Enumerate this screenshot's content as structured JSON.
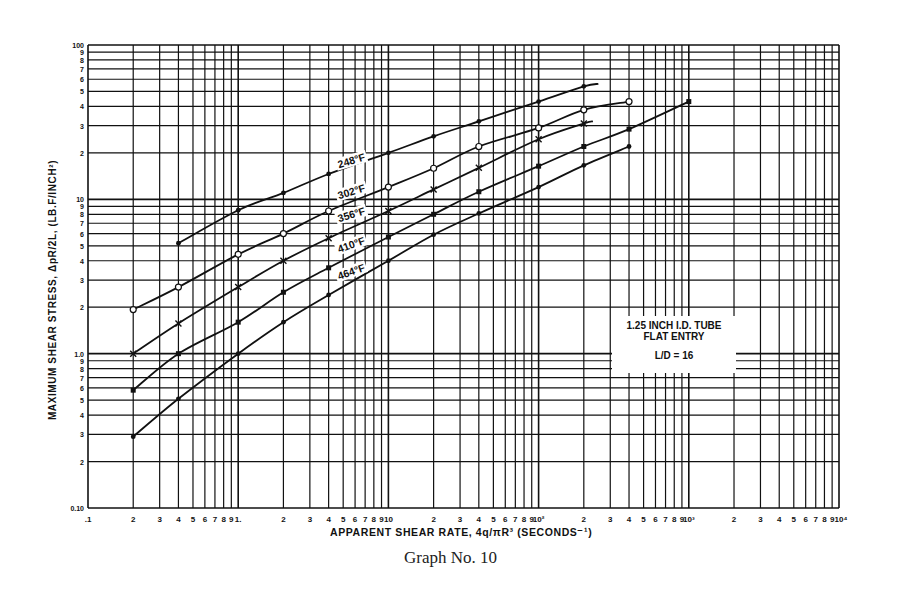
{
  "caption": "Graph No. 10",
  "chart_data": {
    "type": "line",
    "title": "",
    "xlabel": "APPARENT SHEAR RATE, 4q/πR³ (SECONDS⁻¹)",
    "ylabel": "MAXIMUM SHEAR STRESS, ΔpR/2L, (LB.F/INCH²)",
    "xscale": "log",
    "yscale": "log",
    "xlim": [
      0.1,
      10000
    ],
    "ylim": [
      0.1,
      100
    ],
    "grid": true,
    "x_tick_labels": [
      ".1",
      "2",
      "3",
      "4",
      "5",
      "6",
      "7",
      "8",
      "9",
      "1.",
      "2",
      "3",
      "4",
      "5",
      "6",
      "7",
      "8",
      "9",
      "10",
      "2",
      "3",
      "4",
      "5",
      "6",
      "7",
      "8",
      "9",
      "10²",
      "2",
      "3",
      "4",
      "5",
      "6",
      "7",
      "8",
      "9",
      "10³",
      "2",
      "3",
      "4",
      "5",
      "6",
      "7",
      "8",
      "9",
      "10⁴"
    ],
    "y_tick_labels": [
      "0.10",
      "2",
      "3",
      "4",
      "5",
      "6",
      "7",
      "8",
      "9",
      "1.0",
      "2",
      "3",
      "4",
      "5",
      "6",
      "7",
      "8",
      "9",
      "10",
      "2",
      "3",
      "4",
      "5",
      "6",
      "7",
      "8",
      "9",
      "100"
    ],
    "annotation": {
      "line1": "1.25 INCH I.D. TUBE",
      "line2": "FLAT ENTRY",
      "line3": "L/D = 16"
    },
    "series": [
      {
        "name": "248°F",
        "marker": "dot",
        "x": [
          0.4,
          1,
          2,
          4,
          10,
          20,
          40,
          100,
          200,
          250
        ],
        "y": [
          5.2,
          8.5,
          11,
          14.6,
          20,
          25.6,
          32,
          43,
          54,
          56
        ]
      },
      {
        "name": "302°F",
        "marker": "circle",
        "x": [
          0.2,
          0.4,
          1,
          2,
          4,
          10,
          20,
          40,
          100,
          200,
          400
        ],
        "y": [
          1.93,
          2.7,
          4.4,
          6.0,
          8.4,
          12,
          15.9,
          22,
          29,
          38,
          43
        ]
      },
      {
        "name": "356°F",
        "marker": "cross",
        "x": [
          0.2,
          0.4,
          1,
          2,
          4,
          10,
          20,
          40,
          100,
          200,
          230
        ],
        "y": [
          1.0,
          1.57,
          2.7,
          4.0,
          5.6,
          8.4,
          11.6,
          16,
          24.5,
          31,
          32
        ]
      },
      {
        "name": "410°F",
        "marker": "square",
        "x": [
          0.2,
          0.4,
          1,
          2,
          4,
          10,
          20,
          40,
          100,
          200,
          400,
          1000
        ],
        "y": [
          0.58,
          1.0,
          1.6,
          2.5,
          3.6,
          5.7,
          8.0,
          11.2,
          16.4,
          22,
          28.5,
          43
        ]
      },
      {
        "name": "464°F",
        "marker": "dot",
        "x": [
          0.2,
          0.4,
          1,
          2,
          4,
          10,
          20,
          40,
          100,
          200,
          400
        ],
        "y": [
          0.29,
          0.51,
          1.0,
          1.6,
          2.4,
          4.0,
          5.9,
          8.1,
          12,
          16.6,
          22
        ]
      }
    ],
    "curve_labels": [
      {
        "text": "248°F",
        "x": 4.6,
        "y": 16.5,
        "angle": -17
      },
      {
        "text": "302°F",
        "x": 4.6,
        "y": 10.4,
        "angle": -17
      },
      {
        "text": "356°F",
        "x": 4.6,
        "y": 7.3,
        "angle": -17
      },
      {
        "text": "410°F",
        "x": 4.6,
        "y": 4.6,
        "angle": -20
      },
      {
        "text": "464°F",
        "x": 4.6,
        "y": 3.1,
        "angle": -20
      }
    ]
  }
}
